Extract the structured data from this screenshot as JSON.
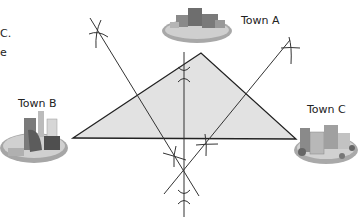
{
  "diagram": {
    "cut_text": [
      "C.",
      "e"
    ],
    "towns": [
      {
        "id": "A",
        "label": "Town A"
      },
      {
        "id": "B",
        "label": "Town B"
      },
      {
        "id": "C",
        "label": "Town C"
      }
    ],
    "colors": {
      "triangle_fill": "#e2e2e2",
      "line": "#222222",
      "town_base": "#9a9a9a"
    }
  }
}
